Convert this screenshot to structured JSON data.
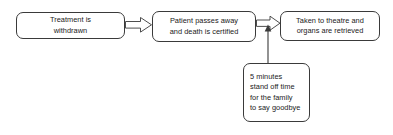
{
  "diagram": {
    "background_color": "#ffffff",
    "line_color": "#3a3a3a",
    "text_color": "#1a1a1a",
    "nodes": [
      {
        "id": "treatment-withdrawn",
        "lines": [
          "Treatment is",
          "withdrawn"
        ],
        "align": "center"
      },
      {
        "id": "death-certified",
        "lines": [
          "Patient passes away",
          "and death is certified"
        ],
        "align": "center"
      },
      {
        "id": "theatre-organs",
        "lines": [
          "Taken to theatre and",
          "organs are retrieved"
        ],
        "align": "center"
      },
      {
        "id": "standoff-time",
        "lines": [
          "5 minutes",
          "stand off time",
          "for the family",
          "to say goodbye"
        ],
        "align": "left"
      }
    ],
    "connectors": [
      {
        "id": "treatment-to-death",
        "style": "block-arrow",
        "from": "treatment-withdrawn",
        "to": "death-certified",
        "direction": "right"
      },
      {
        "id": "death-to-theatre",
        "style": "block-arrow",
        "from": "death-certified",
        "to": "theatre-organs",
        "direction": "right"
      },
      {
        "id": "standoff-to-flow",
        "style": "line-arrow",
        "from": "standoff-time",
        "to": "death-to-theatre",
        "direction": "up"
      }
    ]
  }
}
